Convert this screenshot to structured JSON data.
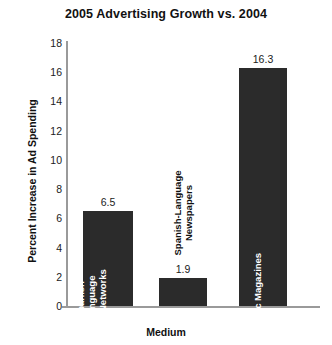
{
  "chart_data": {
    "type": "bar",
    "title": "2005 Advertising Growth vs. 2004",
    "xlabel": "Medium",
    "ylabel": "Percent Increase in Ad Spending",
    "categories": [
      "Spanish-Language TV Networks",
      "Spanish-Language Newspapers",
      "Hispanic Magazines"
    ],
    "category_lines": [
      [
        "Spanish-",
        "Language",
        "TV Networks"
      ],
      [
        "Spanish-Language",
        "Newspapers"
      ],
      [
        "Hispanic Magazines"
      ]
    ],
    "values": [
      6.5,
      1.9,
      16.3
    ],
    "value_labels": [
      "6.5",
      "1.9",
      "16.3"
    ],
    "ylim": [
      0,
      18
    ],
    "ytick_step": 2,
    "yticks": [
      18,
      16,
      14,
      12,
      10,
      8,
      6,
      4,
      2,
      0
    ],
    "ytick_labels": [
      "18",
      "16",
      "14",
      "12",
      "10",
      "8",
      "6",
      "4",
      "2",
      "0"
    ],
    "grid": false,
    "legend": false,
    "bar_color": "#2b2b2b",
    "axis_color": "#9a9a9a",
    "background": "#ffffff",
    "label_inside_bar": [
      true,
      false,
      true
    ]
  }
}
